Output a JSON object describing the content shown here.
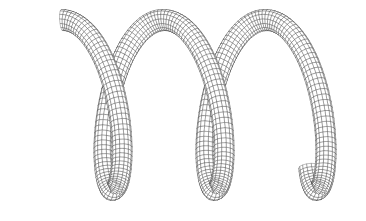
{
  "figure": {
    "background": "#ffffff",
    "line_color": "#222222",
    "helix": {
      "turns": 2.62,
      "start_phase_deg": 90,
      "center_x_start": 62,
      "center_x_step_per_turn": 102,
      "center_y": 105,
      "radius_x": 30,
      "radius_y": 85,
      "tube_radius": 10,
      "axial_segments": 260,
      "ring_segments": 14
    }
  }
}
